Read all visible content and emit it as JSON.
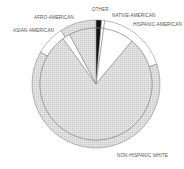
{
  "chart_data": {
    "type": "pie",
    "subtype": "nested pie (inner pie with outer ring)",
    "title": "",
    "categories": [
      "Other",
      "Native-American",
      "Hispanic-American",
      "Non-Hispanic White",
      "Asian-American",
      "Afro-American"
    ],
    "series": [
      {
        "name": "outer ring",
        "values": [
          1.4,
          0.8,
          17.8,
          63.3,
          7.5,
          9.2
        ]
      },
      {
        "name": "inner pie",
        "values": [
          1.4,
          0.8,
          8.9,
          78.9,
          2.2,
          7.8
        ]
      }
    ],
    "labels": {
      "other": "OTHER",
      "native": "NATIVE-AMERICAN",
      "hispanic": "HISPANIC-AMERICAN",
      "white": "NON-HISPANIC WHITE",
      "asian": "ASIAN-AMERICAN",
      "afro": "AFRO-AMERICAN"
    },
    "colors": {
      "other": "#111111",
      "native": "#ffffff",
      "hispanic": "#ffffff",
      "white": "#dcdcdc",
      "asian": "#ffffff",
      "afro": "#dcdcdc",
      "stroke": "#666666"
    },
    "legend": "none (direct labels)"
  }
}
